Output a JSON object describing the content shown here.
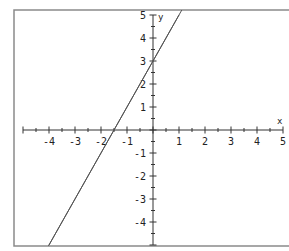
{
  "chart_data": {
    "type": "line",
    "title": "",
    "xlabel": "x",
    "ylabel": "y",
    "xlim": [
      -5,
      5
    ],
    "ylim": [
      -5,
      5
    ],
    "grid": false,
    "x_ticks": [
      -4,
      -3,
      -2,
      -1,
      1,
      2,
      3,
      4,
      5
    ],
    "y_ticks": [
      5,
      4,
      3,
      2,
      1,
      -1,
      -2,
      -3,
      -4
    ],
    "series": [
      {
        "name": "y = 2x + 3",
        "x": [
          -4,
          1
        ],
        "y": [
          -5,
          5
        ]
      }
    ],
    "annotations": []
  },
  "colors": {
    "frame": "#8a8a8a",
    "axis": "#333333",
    "line": "#555555"
  }
}
